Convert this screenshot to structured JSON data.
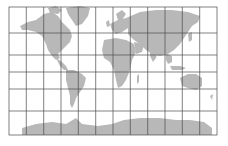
{
  "map": {
    "type": "world-map",
    "projection": "cylindrical",
    "frame": {
      "left": 9,
      "top": 7,
      "right": 217,
      "bottom": 135
    },
    "graticule": {
      "meridians_x": [
        9,
        26.3,
        43.7,
        61,
        78.3,
        95.7,
        113,
        130.3,
        147.7,
        165,
        182.3,
        199.7,
        217
      ],
      "parallels_y": [
        7,
        33,
        55,
        72,
        89,
        111,
        135
      ]
    },
    "colors": {
      "land": "#b5b5b5",
      "grid": "#4a4a4a",
      "background": "#ffffff"
    }
  }
}
